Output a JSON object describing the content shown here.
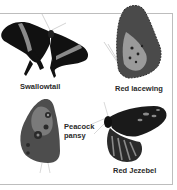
{
  "figure": {
    "butterflies": [
      {
        "name": "Swallowtail",
        "caption": "Swallowtail"
      },
      {
        "name": "Red lacewing",
        "caption": "Red lacewing"
      },
      {
        "name": "Peacock pansy",
        "caption_line1": "Peacock",
        "caption_line2": "pansy"
      },
      {
        "name": "Red Jezebel",
        "caption": "Red Jezebel"
      }
    ],
    "colors": {
      "frame": "#bdbdbd",
      "wing_dark": "#111111",
      "wing_band": "#8a8a8a",
      "caption_text": "#2a2a2a"
    }
  }
}
